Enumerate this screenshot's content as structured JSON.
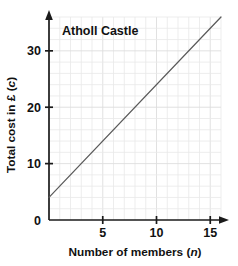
{
  "chart_data": {
    "type": "line",
    "title": "Atholl Castle",
    "xlabel_prefix": "Number of members (",
    "xlabel_var": "n",
    "xlabel_suffix": ")",
    "xlabel": "Number of members (n)",
    "ylabel_prefix": "Total cost in £ (",
    "ylabel_var": "c",
    "ylabel_suffix": ")",
    "ylabel": "Total cost in £ (c)",
    "xlim": [
      0,
      16
    ],
    "ylim": [
      0,
      36
    ],
    "xticks": [
      5,
      10,
      15
    ],
    "xtick_labels": [
      "5",
      "10",
      "15"
    ],
    "yticks": [
      0,
      10,
      20,
      30
    ],
    "ytick_labels": [
      "0",
      "10",
      "20",
      "30"
    ],
    "x_minor_step": 1,
    "y_minor_step": 2,
    "grid": true,
    "legend": "none",
    "series": [
      {
        "name": "Total cost",
        "equation": "c = 2n + 4",
        "intercept": 4,
        "slope": 2,
        "x": [
          0,
          16
        ],
        "values": [
          4,
          36
        ],
        "color": "#5a5a5a"
      }
    ],
    "colors": {
      "line": "#5a5a5a",
      "axis": "#1a1a1a",
      "grid_minor": "#e9e9e9",
      "grid_major": "#dedede",
      "text": "#111111",
      "background": "#ffffff"
    }
  },
  "icons": {
    "x_axis_arrow": "arrow-right-icon",
    "y_axis_arrow": "arrow-up-icon"
  }
}
